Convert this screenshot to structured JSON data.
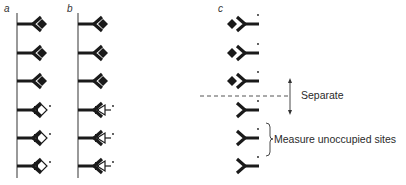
{
  "colors": {
    "ink": "#1a1a1a",
    "line": "#555555",
    "background": "#ffffff"
  },
  "panels": [
    {
      "label": "a",
      "description": "Solid-phase antibodies, rows 1-3 bound to unlabeled antigen (filled diamond), rows 4-6 bound to labeled antigen (open diamond, star)"
    },
    {
      "label": "b",
      "description": "Solid-phase antibodies, rows 1-3 bound to unlabeled antigen (filled diamond), rows 4-6 bound to labeled hapten (open arrow, star)"
    },
    {
      "label": "c",
      "description": "Labeled antibodies, rows 1-3 bound to antigen (filled diamond), rows 4-6 unoccupied"
    }
  ],
  "annotations": {
    "separate": "Separate",
    "measure": "Measure unoccupied sites",
    "label_marker": "*"
  },
  "row_y": [
    24,
    53,
    81,
    110,
    138,
    166
  ]
}
